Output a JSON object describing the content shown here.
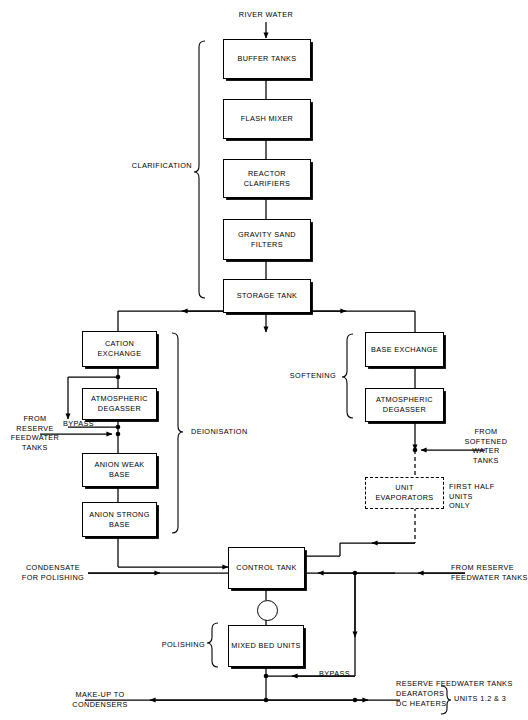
{
  "diagram": {
    "boxes": [
      {
        "id": "buffer_tanks",
        "label": "BUFFER\nTANKS"
      },
      {
        "id": "flash_mixer",
        "label": "FLASH\nMIXER"
      },
      {
        "id": "reactor_clarifiers",
        "label": "REACTOR\nCLARIFIERS"
      },
      {
        "id": "gravity_sand",
        "label": "GRAVITY\nSAND\nFILTERS"
      },
      {
        "id": "storage_tank",
        "label": "STORAGE\nTANK"
      },
      {
        "id": "cation_exchange",
        "label": "CATION\nEXCHANGE"
      },
      {
        "id": "atm_degasser_left",
        "label": "ATMOSPHERIC\nDEGASSER"
      },
      {
        "id": "anion_weak",
        "label": "ANION\nWEAK\nBASE"
      },
      {
        "id": "anion_strong",
        "label": "ANION\nSTRONG\nBASE"
      },
      {
        "id": "base_exchange",
        "label": "BASE\nEXCHANGE"
      },
      {
        "id": "atm_degasser_right",
        "label": "ATMOSPHERIC\nDEGASSER"
      },
      {
        "id": "unit_evaporators",
        "label": "UNIT\nEVAPORATORS"
      },
      {
        "id": "control_tank",
        "label": "CONTROL\nTANK"
      },
      {
        "id": "mixed_bed_units",
        "label": "MIXED\nBED\nUNITS"
      }
    ],
    "labels": {
      "river_water": "RIVER WATER",
      "clarification": "CLARIFICATION",
      "softening": "SOFTENING",
      "deionisation": "DEIONISATION",
      "polishing": "POLISHING",
      "bypass_left": "BYPASS",
      "bypass_bottom": "BYPASS",
      "from_reserve_feedwater_tanks_left": "FROM\nRESERVE\nFEEDWATER\nTANKS",
      "from_softened_water_tanks": "FROM\nSOFTENED\nWATER\nTANKS",
      "first_half_units_only": "FIRST HALF\nUNITS\nONLY",
      "condensate_for_polishing": "CONDENSATE\nFOR POLISHING",
      "from_reserve_feedwater_tanks_right": "FROM RESERVE\nFEEDWATER TANKS",
      "make_up_to_condensers": "MAKE-UP TO\nCONDENSERS",
      "reserve_feedwater_tanks": "RESERVE FEEDWATER TANKS",
      "dearators": "DEARATORS",
      "dc_heaters": "DC HEATERS",
      "units_123": "UNITS 1.2 & 3"
    },
    "colors": {
      "line": "#000000",
      "background": "#ffffff"
    }
  }
}
